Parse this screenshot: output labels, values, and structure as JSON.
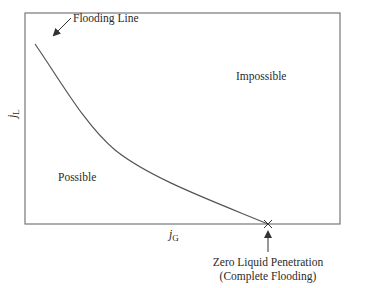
{
  "diagram": {
    "labels": {
      "flooding_line": "Flooding Line",
      "impossible": "Impossible",
      "possible": "Possible",
      "y_axis_main": "j",
      "y_axis_sub": "L",
      "x_axis_main": "j",
      "x_axis_sub": "G",
      "zero_penetration_line1": "Zero Liquid Penetration",
      "zero_penetration_line2": "(Complete Flooding)"
    },
    "colors": {
      "line": "#555555",
      "text": "#2a2a2a"
    }
  }
}
